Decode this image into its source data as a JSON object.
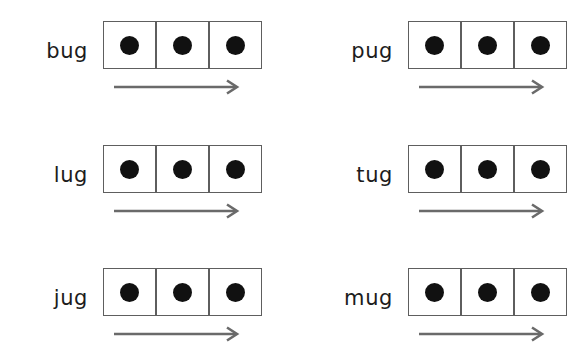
{
  "page": {
    "background_color": "#ffffff",
    "width": 581,
    "height": 356,
    "layout": "2-column x 3-row worksheet grid"
  },
  "style": {
    "box_border_color": "#5e5e5e",
    "dot_color": "#111111",
    "arrow_color": "#6a6a6a",
    "text_color": "#1c1c1c"
  },
  "icons": {
    "dot": "filled-circle",
    "arrow": "right-arrow-icon"
  },
  "items": [
    {
      "word": "bug",
      "boxes": 3,
      "dots": [
        1,
        1,
        1
      ],
      "arrow": "right-arrow",
      "column": 0,
      "row": 0
    },
    {
      "word": "pug",
      "boxes": 3,
      "dots": [
        1,
        1,
        1
      ],
      "arrow": "right-arrow",
      "column": 1,
      "row": 0
    },
    {
      "word": "lug",
      "boxes": 3,
      "dots": [
        1,
        1,
        1
      ],
      "arrow": "right-arrow",
      "column": 0,
      "row": 1
    },
    {
      "word": "tug",
      "boxes": 3,
      "dots": [
        1,
        1,
        1
      ],
      "arrow": "right-arrow",
      "column": 1,
      "row": 1
    },
    {
      "word": "jug",
      "boxes": 3,
      "dots": [
        1,
        1,
        1
      ],
      "arrow": "right-arrow",
      "column": 0,
      "row": 2
    },
    {
      "word": "mug",
      "boxes": 3,
      "dots": [
        1,
        1,
        1
      ],
      "arrow": "right-arrow",
      "column": 1,
      "row": 2
    }
  ]
}
